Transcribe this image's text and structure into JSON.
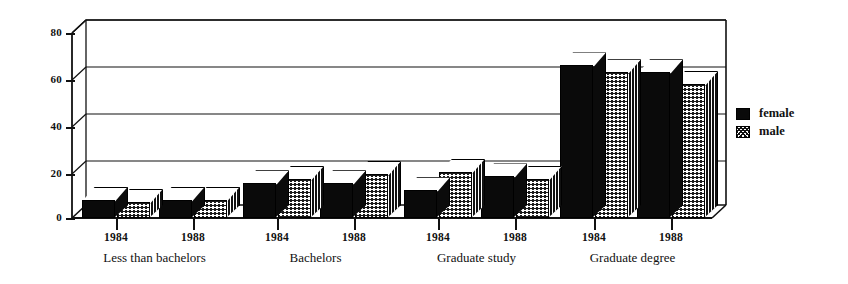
{
  "chart_data": {
    "type": "bar",
    "title": "",
    "subtitle": "",
    "xlabel": "",
    "ylabel": "",
    "ylim": [
      0,
      80
    ],
    "yticks": [
      0,
      20,
      40,
      60,
      80
    ],
    "grid": true,
    "grid_axis": "y",
    "legend_position": "right",
    "style": "3d-grouped-bar",
    "categories": [
      "Less than bachelors 1984",
      "Less than bachelors 1988",
      "Bachelors 1984",
      "Bachelors 1988",
      "Graduate study 1984",
      "Graduate study 1988",
      "Graduate degree 1984",
      "Graduate degree 1988"
    ],
    "groups": [
      {
        "label": "Less than bachelors",
        "years": [
          "1984",
          "1988"
        ]
      },
      {
        "label": "Bachelors",
        "years": [
          "1984",
          "1988"
        ]
      },
      {
        "label": "Graduate study",
        "years": [
          "1984",
          "1988"
        ]
      },
      {
        "label": "Graduate degree",
        "years": [
          "1984",
          "1988"
        ]
      }
    ],
    "series": [
      {
        "name": "female",
        "color": "#0a0a0a",
        "pattern": "solid",
        "values": [
          8,
          8,
          15,
          15,
          12,
          18,
          66,
          63
        ]
      },
      {
        "name": "male",
        "color": "#ffffff",
        "pattern": "cross-hatch",
        "values": [
          7,
          8,
          17,
          19,
          20,
          17,
          63,
          58
        ]
      }
    ]
  },
  "axis": {
    "y_tick_labels": [
      "80",
      "60",
      "40",
      "20",
      "0"
    ]
  },
  "legend": {
    "items": [
      {
        "label": "female",
        "pattern": "solid"
      },
      {
        "label": "male",
        "pattern": "cross-hatch"
      }
    ]
  }
}
